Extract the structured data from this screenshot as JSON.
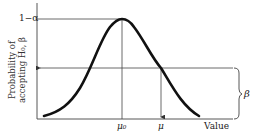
{
  "figure": {
    "type": "operating-characteristic-curve",
    "y_axis_label_line1": "Probability of",
    "y_axis_label_line2": "accepting H₀, β",
    "x_axis_label": "Value",
    "y_tick_top": "1−α",
    "x_tick_mu0": "μ₀",
    "x_tick_mu": "μ",
    "brace_label": "β",
    "colors": {
      "curve": "#111111",
      "lines": "#444444",
      "background": "#ffffff"
    }
  }
}
